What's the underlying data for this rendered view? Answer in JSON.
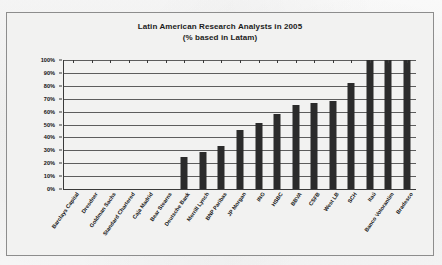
{
  "chart_data": {
    "type": "bar",
    "title": "Latin American Research Analysts in 2005",
    "subtitle": "(% based in Latam)",
    "xlabel": "",
    "ylabel": "",
    "ylim": [
      0,
      100
    ],
    "ytick_labels": [
      "100%",
      "90%",
      "80%",
      "70%",
      "60%",
      "50%",
      "40%",
      "30%",
      "20%",
      "10%",
      "0%"
    ],
    "ytick_values": [
      100,
      90,
      80,
      70,
      60,
      50,
      40,
      30,
      20,
      10,
      0
    ],
    "grid": true,
    "legend": "none",
    "unit": "%",
    "categories": [
      "Barclays Capital",
      "Dresdner",
      "Goldman Sachs",
      "Standard Chartered",
      "Caja Madrid",
      "Bear Stearns",
      "Deutsche Bank",
      "Merrill Lynch",
      "BNP Paribas",
      "JP Morgan",
      "ING",
      "HSBC",
      "BBVA",
      "CSFB",
      "West LB",
      "SCH",
      "Itaú",
      "Banco Votorantim",
      "Bradesco"
    ],
    "values": [
      0,
      0,
      0,
      0,
      0,
      0,
      25,
      29,
      33,
      46,
      51,
      58,
      65,
      67,
      68,
      82,
      100,
      100,
      100
    ],
    "series": [
      {
        "name": "% based in Latam",
        "values": [
          0,
          0,
          0,
          0,
          0,
          0,
          25,
          29,
          33,
          46,
          51,
          58,
          65,
          67,
          68,
          82,
          100,
          100,
          100
        ]
      }
    ],
    "colors": {
      "bar": "#2b2b2b",
      "axis": "#3a3a3a",
      "gridline": "#5d5d5d",
      "plot_background": "#f2f2f1",
      "frame_border": "#8d8d8d",
      "text": "#141414"
    }
  }
}
